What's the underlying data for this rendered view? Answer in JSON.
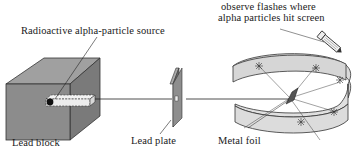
{
  "diagram": {
    "type": "experimental-apparatus",
    "labels": {
      "source": "Radioactive alpha-particle source",
      "observe_line1": "observe flashes where",
      "observe_line2": "alpha particles hit screen",
      "lead_block": "Lead block",
      "lead_plate": "Lead plate",
      "metal_foil": "Metal foil"
    },
    "components": [
      {
        "name": "lead-block",
        "icon": "cube"
      },
      {
        "name": "radioactive-source",
        "icon": "dot"
      },
      {
        "name": "alpha-beam",
        "icon": "line"
      },
      {
        "name": "lead-plate",
        "icon": "slit-plate"
      },
      {
        "name": "metal-foil",
        "icon": "foil"
      },
      {
        "name": "fluorescent-screen",
        "icon": "curved-band"
      },
      {
        "name": "microscope",
        "icon": "microscope-icon"
      }
    ],
    "colors": {
      "lead_gray": "#8a8a8a",
      "lead_dark": "#6e6e6e",
      "lead_light": "#a3a3a3",
      "screen_fill": "#dcdcdc",
      "line": "#222222",
      "background": "#ffffff"
    }
  }
}
